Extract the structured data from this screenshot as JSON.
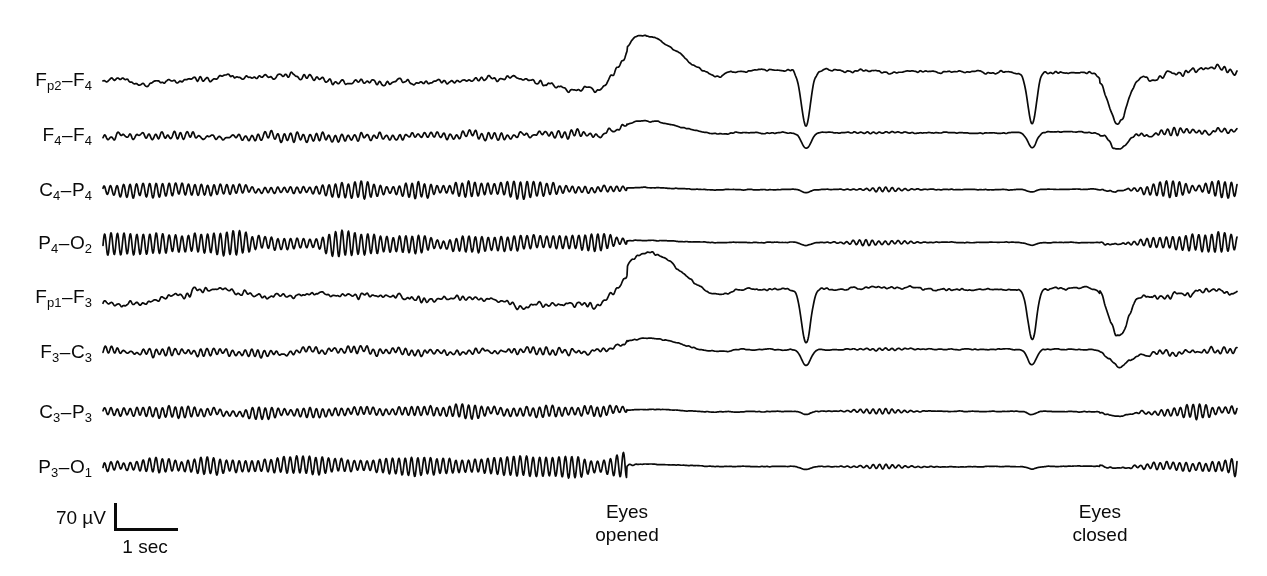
{
  "figure": {
    "background_color": "#ffffff",
    "trace_color": "#0a0a0a",
    "width": 1267,
    "height": 576
  },
  "channels": [
    {
      "name": "channel-fp2-f4",
      "label_main": "F",
      "label_sub1": "p2",
      "label_dash": "–",
      "label_main2": "F",
      "label_sub2": "4",
      "baseline_y": 80,
      "label_x": 92,
      "region": "right-frontopolar",
      "alpha_amplitude": 1.5,
      "noise_amplitude": 3.2,
      "slow_amplitude": 6.5,
      "eye_artifact": "large"
    },
    {
      "name": "channel-f4-f4",
      "label_main": "F",
      "label_sub1": "4",
      "label_dash": "–",
      "label_main2": "F",
      "label_sub2": "4",
      "baseline_y": 135,
      "label_x": 92,
      "region": "right-frontal",
      "alpha_amplitude": 4.0,
      "noise_amplitude": 2.6,
      "slow_amplitude": 2.0,
      "eye_artifact": "medium"
    },
    {
      "name": "channel-c4-p4",
      "label_main": "C",
      "label_sub1": "4",
      "label_dash": "–",
      "label_main2": "P",
      "label_sub2": "4",
      "baseline_y": 190,
      "label_x": 92,
      "region": "right-centroparietal",
      "alpha_amplitude": 9.0,
      "noise_amplitude": 1.4,
      "slow_amplitude": 1.0,
      "eye_artifact": "small"
    },
    {
      "name": "channel-p4-o2",
      "label_main": "P",
      "label_sub1": "4",
      "label_dash": "–",
      "label_main2": "O",
      "label_sub2": "2",
      "baseline_y": 243,
      "label_x": 92,
      "region": "right-parieto-occipital",
      "alpha_amplitude": 13.0,
      "noise_amplitude": 1.3,
      "slow_amplitude": 1.0,
      "eye_artifact": "small"
    },
    {
      "name": "channel-fp1-f3",
      "label_main": "F",
      "label_sub1": "p1",
      "label_dash": "–",
      "label_main2": "F",
      "label_sub2": "3",
      "baseline_y": 297,
      "label_x": 92,
      "region": "left-frontopolar",
      "alpha_amplitude": 1.5,
      "noise_amplitude": 3.0,
      "slow_amplitude": 7.5,
      "eye_artifact": "large"
    },
    {
      "name": "channel-f3-c3",
      "label_main": "F",
      "label_sub1": "3",
      "label_dash": "–",
      "label_main2": "C",
      "label_sub2": "3",
      "baseline_y": 352,
      "label_x": 92,
      "region": "left-frontocentral",
      "alpha_amplitude": 3.6,
      "noise_amplitude": 2.4,
      "slow_amplitude": 2.0,
      "eye_artifact": "medium"
    },
    {
      "name": "channel-c3-p3",
      "label_main": "C",
      "label_sub1": "3",
      "label_dash": "–",
      "label_main2": "P",
      "label_sub2": "3",
      "baseline_y": 412,
      "label_x": 92,
      "region": "left-centroparietal",
      "alpha_amplitude": 8.5,
      "noise_amplitude": 1.4,
      "slow_amplitude": 1.0,
      "eye_artifact": "small"
    },
    {
      "name": "channel-p3-o1",
      "label_main": "P",
      "label_sub1": "3",
      "label_dash": "–",
      "label_main2": "O",
      "label_sub2": "1",
      "baseline_y": 467,
      "label_x": 92,
      "region": "left-parieto-occipital",
      "alpha_amplitude": 14.5,
      "noise_amplitude": 1.2,
      "slow_amplitude": 1.0,
      "eye_artifact": "small"
    }
  ],
  "events": [
    {
      "name": "event-eyes-opened",
      "line1": "Eyes",
      "line2": "opened",
      "x": 627,
      "y": 500
    },
    {
      "name": "event-eyes-closed",
      "line1": "Eyes",
      "line2": "closed",
      "x": 1100,
      "y": 500
    }
  ],
  "scale_bar": {
    "amplitude_label": "70 µV",
    "amplitude_label_x": 106,
    "amplitude_label_y": 518,
    "time_label": "1 sec",
    "time_label_x": 145,
    "time_label_y": 536,
    "corner_x": 114,
    "top_y": 503,
    "bottom_y": 531,
    "right_x": 178,
    "thickness": 3
  },
  "chart_data": {
    "type": "line",
    "xlabel": "Time",
    "ylabel": "Amplitude",
    "grid": false,
    "legend": "none",
    "trace_start_x": 103,
    "trace_end_x": 1237,
    "eyes_opened_x": 627,
    "eyes_closed_x": 1100,
    "amplitude_calibration_uv": 70,
    "amplitude_calibration_px": 28,
    "time_calibration_sec": 1,
    "time_calibration_px": 64,
    "alpha_frequency_hz": 10,
    "series": [
      {
        "name": "Fp2–F4",
        "state_before": "alpha-absent-slow-drift",
        "state_during": "suppressed-with-blinks",
        "state_after": "recovering"
      },
      {
        "name": "F4–F4",
        "state_before": "low-alpha",
        "state_during": "suppressed",
        "state_after": "alpha-returns"
      },
      {
        "name": "C4–P4",
        "state_before": "moderate-alpha",
        "state_during": "suppressed",
        "state_after": "alpha-returns"
      },
      {
        "name": "P4–O2",
        "state_before": "high-alpha",
        "state_during": "suppressed",
        "state_after": "alpha-returns"
      },
      {
        "name": "Fp1–F3",
        "state_before": "alpha-absent-slow-drift",
        "state_during": "suppressed-with-blinks",
        "state_after": "recovering"
      },
      {
        "name": "F3–C3",
        "state_before": "low-alpha",
        "state_during": "suppressed",
        "state_after": "alpha-returns"
      },
      {
        "name": "C3–P3",
        "state_before": "moderate-alpha",
        "state_during": "suppressed",
        "state_after": "alpha-returns"
      },
      {
        "name": "P3–O1",
        "state_before": "highest-alpha",
        "state_during": "suppressed",
        "state_after": "alpha-returns"
      }
    ]
  }
}
